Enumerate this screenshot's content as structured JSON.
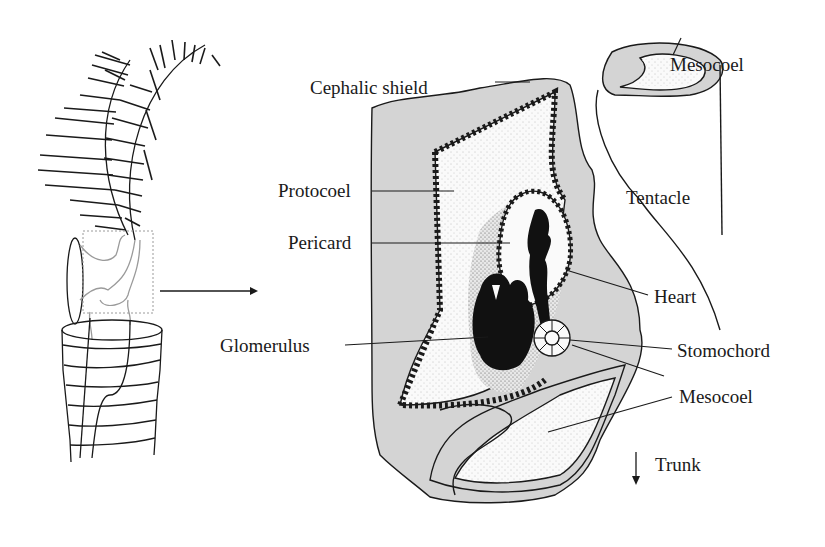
{
  "figure": {
    "colors": {
      "line": "#1a1a1a",
      "tissue_fill": "#d4d4d4",
      "coelom_fill": "#fafafa",
      "inset_box": "#9a9a9a",
      "organ_black": "#111111"
    }
  },
  "labels": {
    "cephalic_shield": "Cephalic shield",
    "mesocoel_top": "Mesocoel",
    "tentacle": "Tentacle",
    "protocoel": "Protocoel",
    "pericard": "Pericard",
    "heart": "Heart",
    "glomerulus": "Glomerulus",
    "stomochord": "Stomochord",
    "mesocoel_bottom": "Mesocoel",
    "trunk": "Trunk"
  },
  "arrows": {
    "enlargement_arrow": "right-arrow",
    "trunk_direction": "down-arrow"
  }
}
